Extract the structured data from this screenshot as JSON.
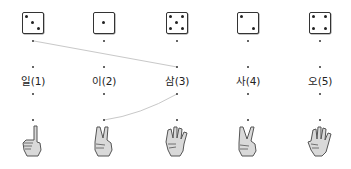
{
  "columns": [
    {
      "label": "일(1)",
      "die_pips": 3,
      "hand_fingers": 1,
      "x": 33
    },
    {
      "label": "이(2)",
      "die_pips": 1,
      "hand_fingers": 2,
      "x": 104
    },
    {
      "label": "삼(3)",
      "die_pips": 5,
      "hand_fingers": 4,
      "x": 177
    },
    {
      "label": "사(4)",
      "die_pips": 2,
      "hand_fingers": 2,
      "x": 248
    },
    {
      "label": "오(5)",
      "die_pips": 4,
      "hand_fingers": 4,
      "x": 320
    }
  ],
  "connections": [
    {
      "from": "die-1",
      "to": "label-3"
    },
    {
      "from": "label-3",
      "to": "hand-2"
    }
  ],
  "colors": {
    "line": "#c8c8c8",
    "dot": "#333333",
    "hand_fill": "#d9d9d9",
    "hand_stroke": "#555555"
  }
}
